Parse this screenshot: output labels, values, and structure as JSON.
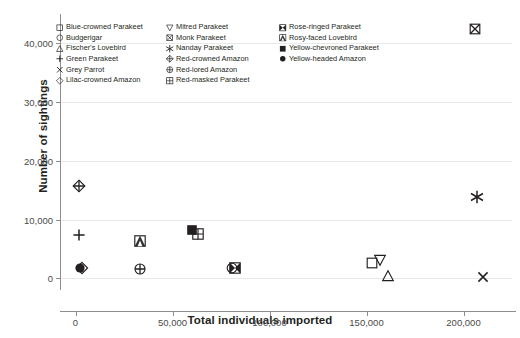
{
  "chart_data": {
    "type": "scatter",
    "title": "",
    "xlabel": "Total individuals imported",
    "ylabel": "Number of sightings",
    "xlim": [
      -8000,
      225000
    ],
    "ylim": [
      -2000,
      45000
    ],
    "xticks": [
      "0",
      "50,000",
      "100,000",
      "150,000",
      "200,000"
    ],
    "xtick_values": [
      0,
      50000,
      100000,
      150000,
      200000
    ],
    "yticks": [
      "0",
      "10,000",
      "20,000",
      "30,000",
      "40,000"
    ],
    "ytick_values": [
      0,
      10000,
      20000,
      30000,
      40000
    ],
    "grid": "horizontal",
    "legend_position": "upper-left-inside",
    "points": [
      {
        "name": "Blue-crowned Parakeet",
        "marker": "square-open",
        "x": 153000,
        "y": 2600
      },
      {
        "name": "Budgerigar",
        "marker": "circle-open",
        "x": 80500,
        "y": 1800
      },
      {
        "name": "Fischer's Lovebird",
        "marker": "triangle-up",
        "x": 161000,
        "y": 400
      },
      {
        "name": "Green Parakeet",
        "marker": "plus",
        "x": 2000,
        "y": 7300
      },
      {
        "name": "Grey Parrot",
        "marker": "cross",
        "x": 210000,
        "y": 200
      },
      {
        "name": "Lilac-crowned Amazon",
        "marker": "diamond-open",
        "x": 3200,
        "y": 1700
      },
      {
        "name": "Mitred Parakeet",
        "marker": "triangle-down",
        "x": 157000,
        "y": 3200
      },
      {
        "name": "Monk Parakeet",
        "marker": "square-x",
        "x": 206000,
        "y": 42500
      },
      {
        "name": "Nanday Parakeet",
        "marker": "asterisk",
        "x": 207000,
        "y": 13900
      },
      {
        "name": "Red-crowned Amazon",
        "marker": "diamond-plus",
        "x": 1800,
        "y": 15700
      },
      {
        "name": "Red-lored Amazon",
        "marker": "circle-plus",
        "x": 33000,
        "y": 1500
      },
      {
        "name": "Red-masked Parakeet",
        "marker": "square-grid",
        "x": 63000,
        "y": 7600
      },
      {
        "name": "Rose-ringed Parakeet",
        "marker": "square-bowtie",
        "x": 82000,
        "y": 1800
      },
      {
        "name": "Rosy-faced Lovebird",
        "marker": "square-tri",
        "x": 33000,
        "y": 6400
      },
      {
        "name": "Yellow-chevroned Parakeet",
        "marker": "square-filled",
        "x": 60000,
        "y": 8200
      },
      {
        "name": "Yellow-headed Amazon",
        "marker": "circle-filled",
        "x": 2200,
        "y": 1800
      }
    ]
  },
  "legend": {
    "columns": [
      [
        {
          "label": "Blue-crowned Parakeet",
          "marker": "square-open"
        },
        {
          "label": "Budgerigar",
          "marker": "circle-open"
        },
        {
          "label": "Fischer's Lovebird",
          "marker": "triangle-up"
        },
        {
          "label": "Green Parakeet",
          "marker": "plus"
        },
        {
          "label": "Grey Parrot",
          "marker": "cross"
        },
        {
          "label": "Lilac-crowned Amazon",
          "marker": "diamond-open"
        }
      ],
      [
        {
          "label": "Mitred Parakeet",
          "marker": "triangle-down"
        },
        {
          "label": "Monk Parakeet",
          "marker": "square-x"
        },
        {
          "label": "Nanday Parakeet",
          "marker": "asterisk"
        },
        {
          "label": "Red-crowned Amazon",
          "marker": "diamond-plus"
        },
        {
          "label": "Red-lored Amazon",
          "marker": "circle-plus"
        },
        {
          "label": "Red-masked Parakeet",
          "marker": "square-grid"
        }
      ],
      [
        {
          "label": "Rose-ringed Parakeet",
          "marker": "square-bowtie"
        },
        {
          "label": "Rosy-faced Lovebird",
          "marker": "square-tri"
        },
        {
          "label": "Yellow-chevroned Parakeet",
          "marker": "square-filled"
        },
        {
          "label": "Yellow-headed Amazon",
          "marker": "circle-filled"
        }
      ]
    ]
  },
  "colors": {
    "marker": "#231f20",
    "axis": "#8d8d8d",
    "grid": "#e8e8e8",
    "text": "#231f20",
    "tick_text": "#4a4a4a",
    "background": "#ffffff"
  }
}
